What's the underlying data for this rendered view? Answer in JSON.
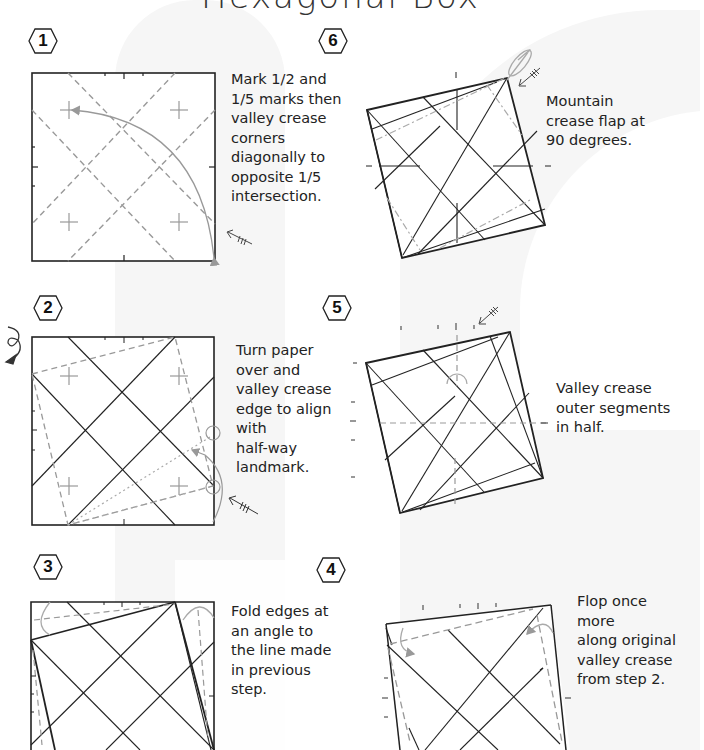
{
  "title": "Hexagonal Box",
  "steps": [
    {
      "number": "1",
      "caption": "Mark 1/2 and\n1/5 marks then\nvalley crease\ncorners\ndiagonally to\nopposite 1/5\nintersection."
    },
    {
      "number": "2",
      "caption": "Turn paper\nover and\nvalley crease\nedge to align\nwith\nhalf-way\nlandmark."
    },
    {
      "number": "3",
      "caption": "Fold edges at\nan angle to\nthe line made\nin previous\nstep."
    },
    {
      "number": "4",
      "caption": "Flop once more\nalong original\nvalley crease\nfrom step 2."
    },
    {
      "number": "5",
      "caption": "Valley crease\nouter segments\nin half."
    },
    {
      "number": "6",
      "caption": "Mountain\ncrease flap at\n90 degrees."
    }
  ],
  "icons": {
    "step_badge": "hexagon-badge-icon",
    "turn_over": "turn-over-arrow-icon",
    "fold_arrow": "fold-arrow-icon",
    "repeat_marker": "repeat-arrow-icon"
  },
  "colors": {
    "line": "#222222",
    "crease": "#999999",
    "watermark": "#f6f6f6"
  }
}
